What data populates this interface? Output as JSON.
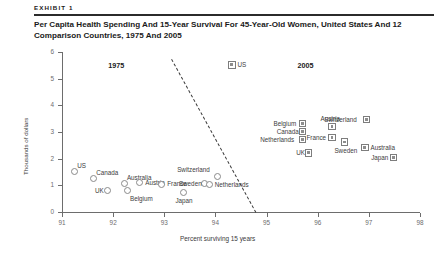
{
  "exhibit": {
    "label": "EXHIBIT 1",
    "title": "Per Capita Health Spending And 15-Year Survival For 45-Year-Old Women, United States And 12 Comparison Countries, 1975 And 2005"
  },
  "chart_data": {
    "type": "scatter",
    "title": "Per Capita Health Spending And 15-Year Survival For 45-Year-Old Women, United States And 12 Comparison Countries, 1975 And 2005",
    "xlabel": "Percent surviving 15 years",
    "ylabel": "Thousands of dollars",
    "xlim": [
      91,
      98
    ],
    "ylim": [
      0,
      6
    ],
    "xticks": [
      "91",
      "92",
      "93",
      "94",
      "95",
      "96",
      "97",
      "98"
    ],
    "yticks": [
      "0",
      "1",
      "2",
      "3",
      "4",
      "5",
      "6"
    ],
    "grid": false,
    "annotations": [
      {
        "text": "1975",
        "x": 92.1,
        "y": 5.5
      },
      {
        "text": "2005",
        "x": 95.8,
        "y": 5.5
      }
    ],
    "trendline": {
      "style": "dashed",
      "x0": 93.15,
      "y0": 5.75,
      "x1": 94.8,
      "y1": 0.0
    },
    "series": [
      {
        "name": "1975",
        "marker": "open-circle",
        "points": [
          {
            "country": "US",
            "x": 91.25,
            "y": 1.52,
            "label_pos": "top-right"
          },
          {
            "country": "Canada",
            "x": 91.62,
            "y": 1.26,
            "label_pos": "top-right"
          },
          {
            "country": "UK",
            "x": 91.88,
            "y": 0.8,
            "label_pos": "left"
          },
          {
            "country": "Australia",
            "x": 92.22,
            "y": 1.08,
            "label_pos": "top-right"
          },
          {
            "country": "Belgium",
            "x": 92.28,
            "y": 0.82,
            "label_pos": "bottom-right"
          },
          {
            "country": "Austria",
            "x": 92.52,
            "y": 1.1,
            "label_pos": "right"
          },
          {
            "country": "France",
            "x": 92.95,
            "y": 1.05,
            "label_pos": "right"
          },
          {
            "country": "Japan",
            "x": 93.38,
            "y": 0.72,
            "label_pos": "bottom"
          },
          {
            "country": "Sweden",
            "x": 93.78,
            "y": 1.06,
            "label_pos": "left"
          },
          {
            "country": "Switzerland",
            "x": 94.05,
            "y": 1.33,
            "label_pos": "top-left"
          },
          {
            "country": "Netherlands",
            "x": 93.88,
            "y": 1.02,
            "label_pos": "right"
          }
        ]
      },
      {
        "name": "2005",
        "marker": "filled-square",
        "points": [
          {
            "country": "US",
            "x": 94.32,
            "y": 5.52,
            "label_pos": "right"
          },
          {
            "country": "Belgium",
            "x": 95.7,
            "y": 3.32,
            "label_pos": "left"
          },
          {
            "country": "Canada",
            "x": 95.7,
            "y": 3.02,
            "label_pos": "left"
          },
          {
            "country": "Netherlands",
            "x": 95.7,
            "y": 2.72,
            "label_pos": "left"
          },
          {
            "country": "UK",
            "x": 95.82,
            "y": 2.22,
            "label_pos": "left"
          },
          {
            "country": "Austria",
            "x": 96.28,
            "y": 3.2,
            "label_pos": "top"
          },
          {
            "country": "France",
            "x": 96.28,
            "y": 2.8,
            "label_pos": "left"
          },
          {
            "country": "Sweden",
            "x": 96.52,
            "y": 2.62,
            "label_pos": "bottom"
          },
          {
            "country": "Switzerland",
            "x": 96.95,
            "y": 3.46,
            "label_pos": "left"
          },
          {
            "country": "Australia",
            "x": 96.92,
            "y": 2.42,
            "label_pos": "right"
          },
          {
            "country": "Japan",
            "x": 97.48,
            "y": 2.05,
            "label_pos": "left"
          }
        ]
      }
    ]
  }
}
